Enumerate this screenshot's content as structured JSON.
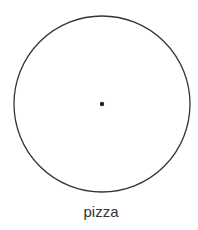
{
  "diagram": {
    "shape": "circle",
    "center_point": true,
    "label": "pizza",
    "stroke_color": "#333333"
  }
}
